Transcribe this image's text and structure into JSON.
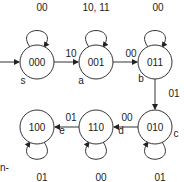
{
  "states": [
    {
      "id": "000",
      "tag": "s",
      "cx": 37,
      "cy": 62
    },
    {
      "id": "001",
      "tag": "a",
      "cx": 96,
      "cy": 62
    },
    {
      "id": "011",
      "tag": "b",
      "cx": 155,
      "cy": 62
    },
    {
      "id": "010",
      "tag": "c",
      "cx": 155,
      "cy": 127
    },
    {
      "id": "110",
      "tag": "d",
      "cx": 96,
      "cy": 127
    },
    {
      "id": "100",
      "tag": "e",
      "cx": 37,
      "cy": 127
    }
  ],
  "self_loops": {
    "s": "00",
    "a": "10, 11",
    "b": "00",
    "c": "01",
    "d": "00",
    "e": "01"
  },
  "transitions": {
    "s_to_a": "10",
    "a_to_b": "00",
    "b_to_c": "01",
    "c_to_d": "00",
    "d_to_e": "01"
  },
  "fragment_text": "n-"
}
